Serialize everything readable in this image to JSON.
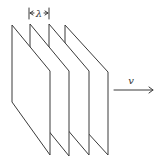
{
  "diagram": {
    "title": "",
    "plane_count": 4,
    "wavelength_label": "λ",
    "velocity_label": "v",
    "colors": {
      "ink": "#3a3a3a",
      "background": "#ffffff"
    }
  }
}
